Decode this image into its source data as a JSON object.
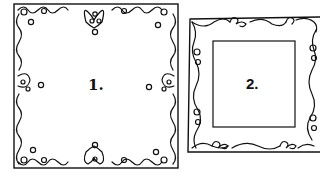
{
  "figures": [
    {
      "id": "frame-1",
      "label": "1.",
      "style": "ornate scroll border with heart motifs and small circles"
    },
    {
      "id": "frame-2",
      "label": "2.",
      "style": "wavy scroll border frame with plain inner rectangle"
    }
  ],
  "colors": {
    "ink": "#111111",
    "background": "#ffffff"
  }
}
